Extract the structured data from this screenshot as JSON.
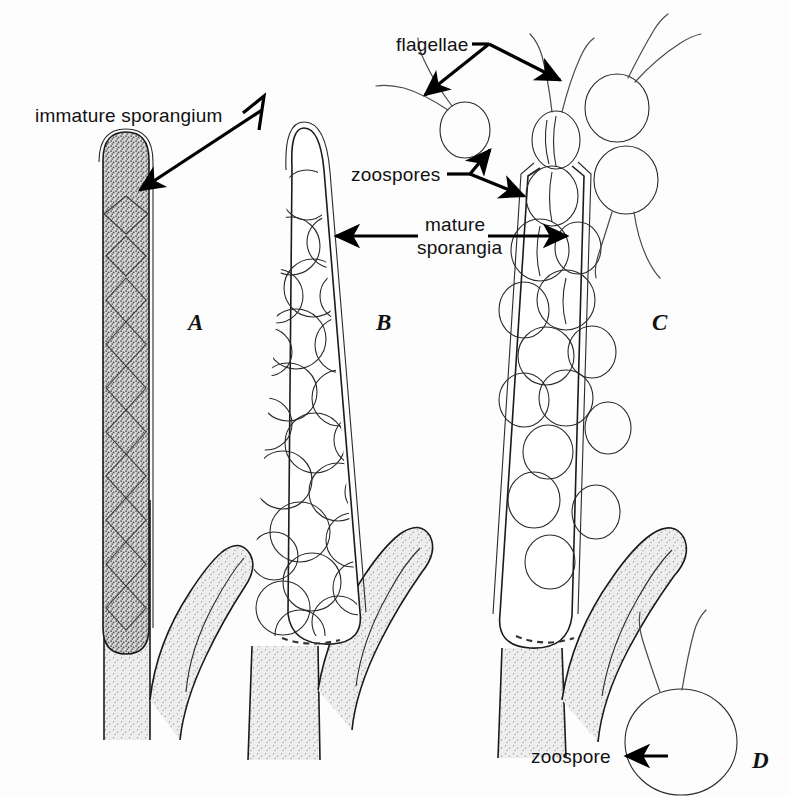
{
  "figure": {
    "background_color": "#fdfdfd",
    "ink_color": "#1b1b1b",
    "fill_color": "#dedede"
  },
  "labels": {
    "immature_sporangium": "immature sporangium",
    "flagellae": "flagellae",
    "zoospores": "zoospores",
    "mature_line1": "mature",
    "mature_line2": "sporangia",
    "zoospore": "zoospore"
  },
  "panels": [
    {
      "letter": "A",
      "caption": "immature sporangium"
    },
    {
      "letter": "B",
      "caption": "mature sporangium packed with zoospores"
    },
    {
      "letter": "C",
      "caption": "mature sporangium discharging zoospores"
    },
    {
      "letter": "D",
      "caption": "free zoospore with two flagellae"
    }
  ]
}
